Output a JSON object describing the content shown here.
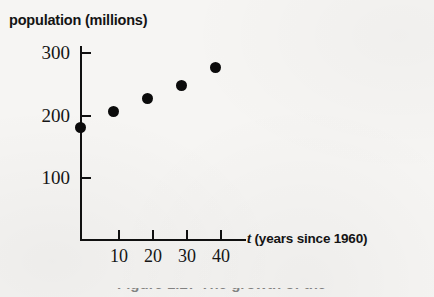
{
  "figure": {
    "background_color": "#f6f5f3",
    "ink_color": "#0b0b0b",
    "caption_partial": "Figure 1.27  The growth of the"
  },
  "chart_data": {
    "type": "scatter",
    "title": "",
    "subtitle": "",
    "xlabel": "t (years since 1960)",
    "xlabel_variable": "t",
    "xlabel_rest": "(years since 1960)",
    "ylabel": "population (millions)",
    "x": [
      0,
      10,
      20,
      30,
      40
    ],
    "values": [
      180,
      205,
      226,
      248,
      277
    ],
    "points": [
      {
        "x": 0,
        "y": 180
      },
      {
        "x": 10,
        "y": 205
      },
      {
        "x": 20,
        "y": 226
      },
      {
        "x": 30,
        "y": 248
      },
      {
        "x": 40,
        "y": 277
      }
    ],
    "xticks": [
      10,
      20,
      30,
      40
    ],
    "xtick_labels": [
      "10",
      "20",
      "30",
      "40"
    ],
    "yticks": [
      100,
      200,
      300
    ],
    "ytick_labels": [
      "100",
      "200",
      "300"
    ],
    "xlim": [
      0,
      50
    ],
    "ylim": [
      0,
      315
    ],
    "grid": false,
    "legend": null,
    "marker": "filled-circle",
    "marker_color": "#0b0b0b"
  }
}
